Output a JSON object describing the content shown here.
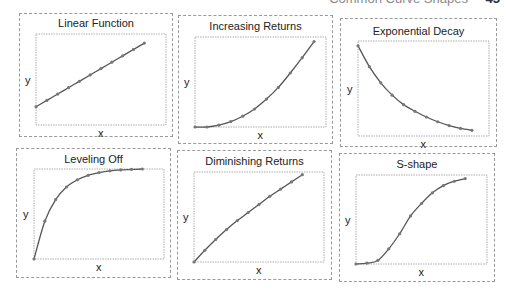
{
  "header": {
    "running_text": "Common Curve Shapes",
    "page_number": "43"
  },
  "style": {
    "line_color": "#555555",
    "marker_color": "#777777",
    "frame_color": "#9a9a9a"
  },
  "chart_data": [
    {
      "type": "line",
      "title": "Linear Function",
      "xlabel": "x",
      "ylabel": "y",
      "grid": false,
      "legend": null,
      "x": [
        0,
        1,
        2,
        3,
        4,
        5,
        6,
        7,
        8,
        9,
        10
      ],
      "values": [
        0.2,
        0.27,
        0.34,
        0.41,
        0.48,
        0.55,
        0.62,
        0.69,
        0.76,
        0.83,
        0.9
      ],
      "xlim": [
        0,
        12
      ],
      "ylim": [
        0,
        1
      ]
    },
    {
      "type": "line",
      "title": "Increasing Returns",
      "xlabel": "x",
      "ylabel": "y",
      "grid": false,
      "legend": null,
      "x": [
        0,
        1,
        2,
        3,
        4,
        5,
        6,
        7,
        8,
        9,
        10
      ],
      "values": [
        0.0,
        0.0,
        0.02,
        0.06,
        0.12,
        0.2,
        0.31,
        0.44,
        0.6,
        0.77,
        0.95
      ],
      "xlim": [
        0,
        11
      ],
      "ylim": [
        0,
        1
      ]
    },
    {
      "type": "line",
      "title": "Exponential Decay",
      "xlabel": "x",
      "ylabel": "y",
      "grid": false,
      "legend": null,
      "x": [
        0,
        1,
        2,
        3,
        4,
        5,
        6,
        7,
        8,
        9,
        10
      ],
      "values": [
        0.95,
        0.73,
        0.56,
        0.43,
        0.33,
        0.26,
        0.2,
        0.15,
        0.11,
        0.08,
        0.06
      ],
      "xlim": [
        0,
        11.5
      ],
      "ylim": [
        0,
        1
      ]
    },
    {
      "type": "line",
      "title": "Leveling Off",
      "xlabel": "x",
      "ylabel": "y",
      "grid": false,
      "legend": null,
      "x": [
        0,
        1,
        2,
        3,
        4,
        5,
        6,
        7,
        8,
        9,
        10
      ],
      "values": [
        0.0,
        0.42,
        0.66,
        0.8,
        0.88,
        0.93,
        0.96,
        0.98,
        0.99,
        0.995,
        1.0
      ],
      "xlim": [
        0,
        12
      ],
      "ylim": [
        0,
        1
      ]
    },
    {
      "type": "line",
      "title": "Diminishing Returns",
      "xlabel": "x",
      "ylabel": "y",
      "grid": false,
      "legend": null,
      "x": [
        0,
        1,
        2,
        3,
        4,
        5,
        6,
        7,
        8,
        9,
        10
      ],
      "values": [
        0.0,
        0.13,
        0.25,
        0.36,
        0.46,
        0.55,
        0.64,
        0.73,
        0.81,
        0.89,
        0.97
      ],
      "xlim": [
        0,
        12
      ],
      "ylim": [
        0,
        1
      ]
    },
    {
      "type": "line",
      "title": "S-shape",
      "xlabel": "x",
      "ylabel": "y",
      "grid": false,
      "legend": null,
      "x": [
        0,
        1,
        2,
        3,
        4,
        5,
        6,
        7,
        8,
        9,
        10
      ],
      "values": [
        0.0,
        0.01,
        0.04,
        0.17,
        0.34,
        0.54,
        0.68,
        0.8,
        0.88,
        0.93,
        0.96
      ],
      "xlim": [
        0,
        12
      ],
      "ylim": [
        0,
        1
      ]
    }
  ]
}
